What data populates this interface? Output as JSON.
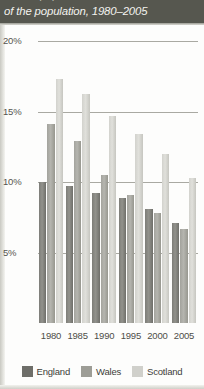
{
  "header": {
    "title": "of the population, 1980–2005",
    "sliver_above": "of the population"
  },
  "chart_data": {
    "type": "bar",
    "title": "of the population, 1980–2005",
    "xlabel": "",
    "ylabel": "",
    "categories": [
      "1980",
      "1985",
      "1990",
      "1995",
      "2000",
      "2005"
    ],
    "series": [
      {
        "name": "England",
        "color": "#6e6e69",
        "values": [
          10.0,
          9.7,
          9.2,
          8.9,
          8.1,
          7.1
        ]
      },
      {
        "name": "Wales",
        "color": "#9d9d96",
        "values": [
          14.1,
          12.9,
          10.5,
          9.1,
          7.8,
          6.7
        ]
      },
      {
        "name": "Scotland",
        "color": "#d0d0cb",
        "values": [
          17.3,
          16.3,
          14.7,
          13.4,
          12.0,
          10.3
        ]
      }
    ],
    "ylim": [
      0,
      20
    ],
    "yticks": [
      5,
      10,
      15,
      20
    ],
    "ytick_labels": [
      "5%",
      "10%",
      "15%",
      "20%"
    ],
    "grid": true,
    "legend_position": "bottom"
  },
  "yaxis": {
    "ticks": [
      {
        "label": "20%",
        "value": 20
      },
      {
        "label": "15%",
        "value": 15
      },
      {
        "label": "10%",
        "value": 10
      },
      {
        "label": "5%",
        "value": 5
      }
    ]
  },
  "xaxis": {
    "ticks": [
      "1980",
      "1985",
      "1990",
      "1995",
      "2000",
      "2005"
    ]
  },
  "legend": {
    "items": [
      {
        "label": "England",
        "color": "#6e6e69"
      },
      {
        "label": "Wales",
        "color": "#9d9d96"
      },
      {
        "label": "Scotland",
        "color": "#d0d0cb"
      }
    ]
  }
}
